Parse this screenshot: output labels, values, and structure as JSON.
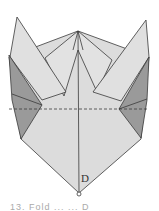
{
  "figure": {
    "type": "origami-fold-diagram",
    "labels": {
      "point_d": "D"
    },
    "caption": "13. Fold ... ... D",
    "colors": {
      "paper_light": "#dcdcdc",
      "paper_dark": "#9a9a9a",
      "line": "#3a3a3a"
    },
    "fold_lines": [
      {
        "kind": "valley-dashed",
        "y": 109
      }
    ]
  }
}
